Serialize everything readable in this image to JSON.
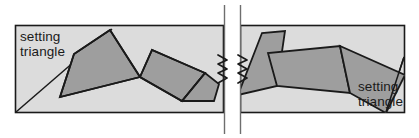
{
  "diagram": {
    "type": "geometric-band-diagram",
    "canvas": {
      "width": 419,
      "height": 138
    },
    "colors": {
      "page_background": "#ffffff",
      "band_fill": "#dcdcdc",
      "shape_fill": "#9e9e9e",
      "outline": "#1a1a1a",
      "text": "#1a1a1a",
      "break_line": "#6e6e6e"
    },
    "labels": [
      {
        "id": "left-label",
        "line1": "setting",
        "line2": "triangle",
        "x": 20,
        "y": 41
      },
      {
        "id": "right-label",
        "line1": "setting",
        "line2": "triangle",
        "x": 358,
        "y": 91
      }
    ],
    "panels": {
      "left": {
        "x": 15,
        "y": 25,
        "width": 209,
        "height": 88
      },
      "right": {
        "x": 240,
        "y": 25,
        "width": 165,
        "height": 88
      }
    },
    "break_symbol": {
      "name": "drawing-break",
      "line_left_x": 224,
      "line_right_x": 240,
      "top_y": 5,
      "bottom_y": 134,
      "squiggle_center_y": 69
    },
    "shapes": [
      {
        "id": "quad-1",
        "points": "60,97 74,54 110,30 140,77"
      },
      {
        "id": "quad-2",
        "points": "140,77 152,50 205,73 182,101"
      },
      {
        "id": "quad-3",
        "points": "182,101 205,73 219,84 214,101"
      },
      {
        "id": "quad-4",
        "points": "245,95 262,33 285,31 277,86"
      },
      {
        "id": "quad-5",
        "points": "277,86 268,53 340,46 350,93"
      },
      {
        "id": "quad-6",
        "points": "350,93 340,46 405,75 386,113"
      }
    ],
    "guide_lines": [
      {
        "id": "left-diagonal",
        "x1": 16,
        "y1": 112,
        "x2": 112,
        "y2": 29
      },
      {
        "id": "right-diagonal",
        "x1": 386,
        "y1": 112,
        "x2": 404,
        "y2": 57
      }
    ]
  }
}
